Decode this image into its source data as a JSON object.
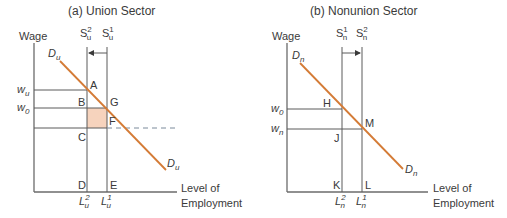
{
  "panels": [
    {
      "title": "(a) Union Sector",
      "y_axis_label": "Wage",
      "x_axis_label_line1": "Level of",
      "x_axis_label_line2": "Employment",
      "demand_label": "D",
      "demand_sub": "u",
      "supply_left": {
        "base": "S",
        "sub": "u",
        "sup": "2"
      },
      "supply_right": {
        "base": "S",
        "sub": "u",
        "sup": "1"
      },
      "shift_direction": "left",
      "wage_labels": [
        {
          "base": "w",
          "sub": "u"
        },
        {
          "base": "w",
          "sub": "0"
        }
      ],
      "employment_labels": [
        {
          "base": "L",
          "sub": "u",
          "sup": "2"
        },
        {
          "base": "L",
          "sub": "u",
          "sup": "1"
        }
      ],
      "points": [
        "A",
        "B",
        "G",
        "F",
        "C",
        "D",
        "E"
      ],
      "shaded_region": "B-G-F-C"
    },
    {
      "title": "(b) Nonunion Sector",
      "y_axis_label": "Wage",
      "x_axis_label_line1": "Level of",
      "x_axis_label_line2": "Employment",
      "demand_label": "D",
      "demand_sub": "n",
      "supply_left": {
        "base": "S",
        "sub": "n",
        "sup": "1"
      },
      "supply_right": {
        "base": "S",
        "sub": "n",
        "sup": "2"
      },
      "shift_direction": "right",
      "wage_labels": [
        {
          "base": "w",
          "sub": "0"
        },
        {
          "base": "w",
          "sub": "n"
        }
      ],
      "employment_labels": [
        {
          "base": "L",
          "sub": "n",
          "sup": "2"
        },
        {
          "base": "L",
          "sub": "n",
          "sup": "1"
        }
      ],
      "points": [
        "H",
        "M",
        "J",
        "K",
        "L"
      ]
    }
  ],
  "colors": {
    "demand": "#d47b36",
    "shade": "#f6d3bd",
    "axis": "#6b6b6b",
    "dashed": "#7a8a9a"
  }
}
